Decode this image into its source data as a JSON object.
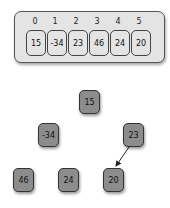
{
  "array": {
    "indices": [
      "0",
      "1",
      "2",
      "3",
      "4",
      "5"
    ],
    "values": [
      "15",
      "-34",
      "23",
      "46",
      "24",
      "20"
    ]
  },
  "tree": {
    "nodes": [
      {
        "id": "n15",
        "label": "15"
      },
      {
        "id": "n-34",
        "label": "-34"
      },
      {
        "id": "n23",
        "label": "23"
      },
      {
        "id": "n46",
        "label": "46"
      },
      {
        "id": "n24",
        "label": "24"
      },
      {
        "id": "n20",
        "label": "20"
      }
    ],
    "edges": [
      {
        "from": "23",
        "to": "20",
        "directed": true
      }
    ]
  },
  "colors": {
    "array_bg": "#e4e4e4",
    "node_fill": "#8c8c8c",
    "border": "#333333"
  }
}
